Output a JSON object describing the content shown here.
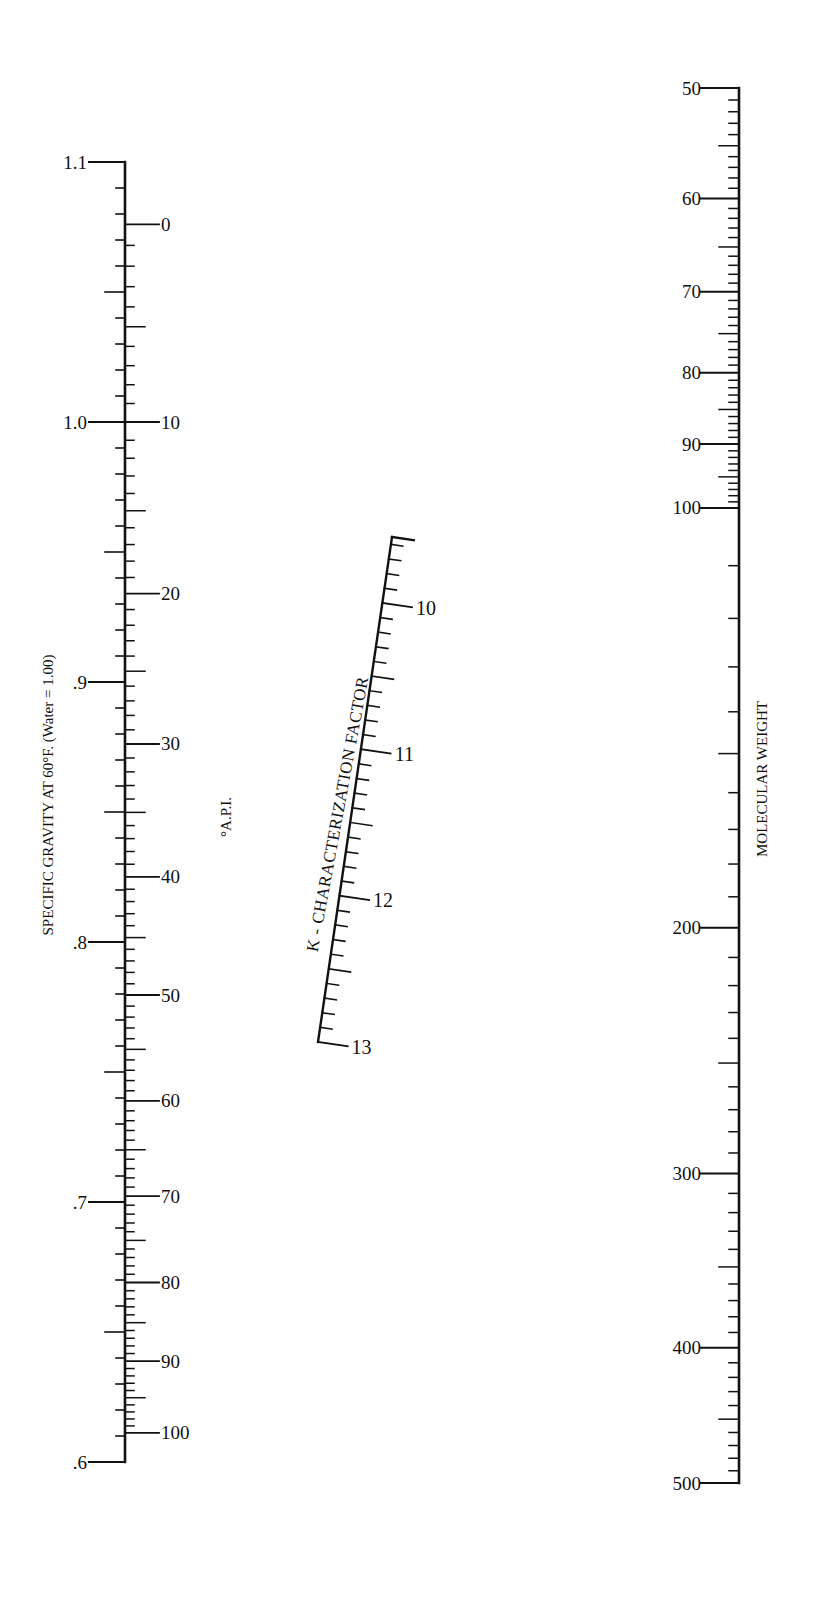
{
  "chart_data": {
    "type": "nomograph",
    "title": "",
    "scales": [
      {
        "id": "specific_gravity",
        "name": "SPECIFIC GRAVITY AT 60°F. (Water = 1.00)",
        "label": "SPECIFIC GRAVITY AT 60°F. (Water = 1.00)",
        "side": "left",
        "scale_type": "linear",
        "range": [
          0.6,
          1.1
        ],
        "major_ticks": [
          1.1,
          1.0,
          0.9,
          0.8,
          0.7,
          0.6
        ],
        "tick_labels": [
          "1.1",
          "1.0",
          ".9",
          ".8",
          ".7",
          ".6"
        ],
        "minor_step": 0.01
      },
      {
        "id": "api_gravity",
        "name": "°A.P.I.",
        "label": "°A.P.I.",
        "side": "right of specific gravity axis",
        "scale_type": "API = 141.5/SG − 131.5",
        "range": [
          0,
          100
        ],
        "major_ticks": [
          0,
          10,
          20,
          30,
          40,
          50,
          60,
          70,
          80,
          90,
          100
        ],
        "tick_labels": [
          "0",
          "10",
          "20",
          "30",
          "40",
          "50",
          "60",
          "70",
          "80",
          "90",
          "100"
        ],
        "minor_step": 1
      },
      {
        "id": "k_factor",
        "name": "K - CHARACTERIZATION FACTOR",
        "label": "K - CHARACTERIZATION FACTOR",
        "side": "center (inclined)",
        "scale_type": "linear",
        "range": [
          9.5,
          13
        ],
        "major_ticks": [
          10,
          11,
          12,
          13
        ],
        "tick_labels": [
          "10",
          "11",
          "12",
          "13"
        ],
        "minor_step": 0.1
      },
      {
        "id": "molecular_weight",
        "name": "MOLECULAR WEIGHT",
        "label": "MOLECULAR WEIGHT",
        "side": "right",
        "scale_type": "log",
        "range": [
          50,
          500
        ],
        "major_ticks": [
          50,
          60,
          70,
          80,
          90,
          100,
          200,
          300,
          400,
          500
        ],
        "tick_labels": [
          "50",
          "60",
          "70",
          "80",
          "90",
          "100",
          "200",
          "300",
          "400",
          "500"
        ]
      }
    ]
  },
  "labels": {
    "sg_title": "SPECIFIC GRAVITY AT 60°F. (Water = 1.00)",
    "api_title": "°A.P.I.",
    "k_title": "K - CHARACTERIZATION FACTOR",
    "mw_title": "MOLECULAR WEIGHT"
  },
  "colors": {
    "ink": "#111111",
    "paper": "#ffffff"
  }
}
